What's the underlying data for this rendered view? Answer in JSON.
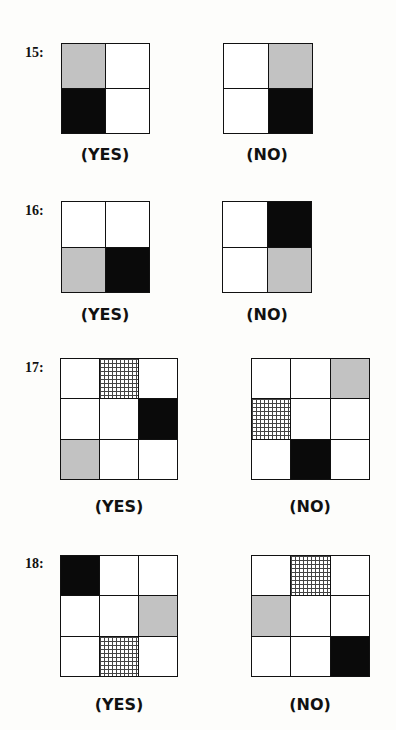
{
  "problems": [
    {
      "number": "15:",
      "size": 2,
      "yes": {
        "cells": [
          "gray",
          "white",
          "black",
          "white"
        ],
        "label": "(YES)"
      },
      "no": {
        "cells": [
          "white",
          "gray",
          "white",
          "black"
        ],
        "label": "(NO)"
      }
    },
    {
      "number": "16:",
      "size": 2,
      "yes": {
        "cells": [
          "white",
          "white",
          "gray",
          "black"
        ],
        "label": "(YES)"
      },
      "no": {
        "cells": [
          "white",
          "black",
          "white",
          "gray"
        ],
        "label": "(NO)"
      }
    },
    {
      "number": "17:",
      "size": 3,
      "yes": {
        "cells": [
          "white",
          "hatch",
          "white",
          "white",
          "white",
          "black",
          "gray",
          "white",
          "white"
        ],
        "label": "(YES)"
      },
      "no": {
        "cells": [
          "white",
          "white",
          "gray",
          "hatch",
          "white",
          "white",
          "white",
          "black",
          "white"
        ],
        "label": "(NO)"
      }
    },
    {
      "number": "18:",
      "size": 3,
      "yes": {
        "cells": [
          "black",
          "white",
          "white",
          "white",
          "white",
          "gray",
          "white",
          "hatch",
          "white"
        ],
        "label": "(YES)"
      },
      "no": {
        "cells": [
          "white",
          "hatch",
          "white",
          "gray",
          "white",
          "white",
          "white",
          "white",
          "black"
        ],
        "label": "(NO)"
      }
    }
  ],
  "colors": {
    "gray": "#c2c2c2",
    "black": "#0a0a0a",
    "white": "#ffffff"
  }
}
